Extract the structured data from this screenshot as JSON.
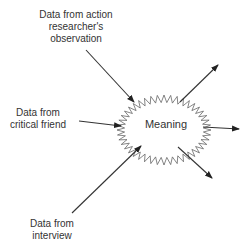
{
  "diagram": {
    "type": "convergence-divergence",
    "center": {
      "label": "Meaning",
      "shape": "starburst"
    },
    "inputs": [
      {
        "id": "observation",
        "lines": [
          "Data from action",
          "researcher's",
          "observation"
        ]
      },
      {
        "id": "critical-friend",
        "lines": [
          "Data from",
          "critical friend"
        ]
      },
      {
        "id": "interview",
        "lines": [
          "Data from",
          "interview"
        ]
      }
    ],
    "outputs_count": 3,
    "colors": {
      "stroke": "#333333",
      "burst": "#666666",
      "text": "#333333",
      "background": "#ffffff"
    }
  }
}
